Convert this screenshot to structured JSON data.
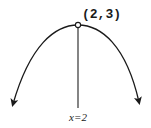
{
  "diagram": {
    "vertex": {
      "x": 2,
      "y": 3,
      "label": "(2,3)"
    },
    "axis_of_symmetry": {
      "label": "x=2"
    },
    "opens": "down",
    "colors": {
      "stroke": "#1a1a1a",
      "background": "#ffffff"
    }
  }
}
